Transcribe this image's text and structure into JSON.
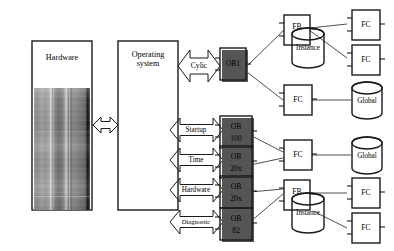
{
  "diagram": {
    "colors": {
      "stroke": "#1a1a1a",
      "connector": "#3a3a3a",
      "background": "#ffffff",
      "shadow": "#555555"
    }
  },
  "hardware": {
    "label": "Hardware",
    "photo_alt": "hardware-rack-photo"
  },
  "operating_system": {
    "label_line1": "Operating",
    "label_line2": "system"
  },
  "events": [
    {
      "label": "Cylic",
      "name": "event-cyclic"
    },
    {
      "label": "Startup",
      "name": "event-startup"
    },
    {
      "label": "Time",
      "name": "event-time"
    },
    {
      "label": "Hardware",
      "name": "event-hardware"
    },
    {
      "label": "Diagnostic",
      "name": "event-diagnostic"
    }
  ],
  "organization_blocks": [
    {
      "line1": "OB1",
      "line2": "",
      "name": "ob-1"
    },
    {
      "line1": "OB",
      "line2": "100",
      "name": "ob-100"
    },
    {
      "line1": "OB",
      "line2": "20x",
      "name": "ob-20x-time"
    },
    {
      "line1": "OB",
      "line2": "20x",
      "name": "ob-20x-hardware"
    },
    {
      "line1": "OB",
      "line2": "82",
      "name": "ob-82"
    }
  ],
  "blocks": {
    "fb_top": "FB",
    "fb_bottom": "FB",
    "fc_top_1": "FC",
    "fc_top_2": "FC",
    "fc_mid": "FC",
    "fc_global": "FC",
    "fc_bottom_1": "FC",
    "fc_bottom_2": "FC"
  },
  "data_blocks": {
    "instance_top": "Instance",
    "instance_bottom": "Instance",
    "global_top": "Global",
    "global_bottom": "Global"
  }
}
